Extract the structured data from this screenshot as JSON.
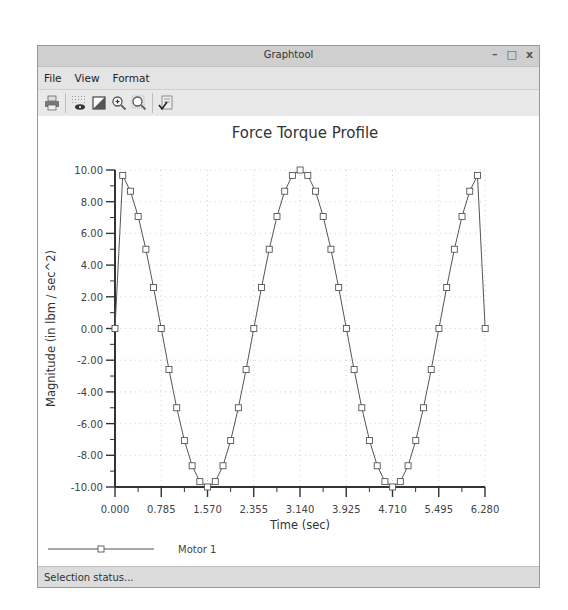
{
  "window": {
    "title": "Graphtool",
    "controls": {
      "minimize": "–",
      "maximize": "□",
      "close": "x"
    }
  },
  "menubar": {
    "items": [
      {
        "label": "File"
      },
      {
        "label": "View"
      },
      {
        "label": "Format"
      }
    ]
  },
  "toolbar": {
    "buttons": [
      {
        "name": "print",
        "icon": "printer-icon"
      },
      {
        "name": "grid-toggle",
        "icon": "grid-eye-icon"
      },
      {
        "name": "background",
        "icon": "fill-square-icon"
      },
      {
        "name": "zoom-in",
        "icon": "zoom-in-icon"
      },
      {
        "name": "zoom-fit",
        "icon": "zoom-fit-icon"
      },
      {
        "name": "properties",
        "icon": "check-document-icon"
      }
    ]
  },
  "statusbar": {
    "text": "Selection status..."
  },
  "colors": {
    "line": "#555555",
    "marker": "#555555",
    "axis": "#333333",
    "grid": "#bbbbbb",
    "titlebar": "#cfcfcf",
    "menubar": "#e4e4e4"
  },
  "chart_data": {
    "type": "line",
    "title": "Force Torque Profile",
    "xlabel": "Time (sec)",
    "ylabel": "Magnitude (in lbm / sec^2)",
    "xlim": [
      0,
      6.28
    ],
    "ylim": [
      -10,
      10
    ],
    "xticks": [
      "0.000",
      "0.785",
      "1.570",
      "2.355",
      "3.140",
      "3.925",
      "4.710",
      "5.495",
      "6.280"
    ],
    "yticks": [
      "10.00",
      "8.00",
      "6.00",
      "4.00",
      "2.00",
      "0.00",
      "-2.00",
      "-4.00",
      "-6.00",
      "-8.00",
      "-10.00"
    ],
    "grid": true,
    "legend_position": "bottom-left",
    "series": [
      {
        "name": "Motor 1",
        "marker": "square",
        "x": [
          0.0,
          0.131,
          0.262,
          0.393,
          0.524,
          0.654,
          0.785,
          0.916,
          1.047,
          1.178,
          1.309,
          1.44,
          1.571,
          1.702,
          1.833,
          1.963,
          2.094,
          2.225,
          2.356,
          2.487,
          2.618,
          2.749,
          2.88,
          3.011,
          3.142,
          3.272,
          3.403,
          3.534,
          3.665,
          3.796,
          3.927,
          4.058,
          4.189,
          4.32,
          4.451,
          4.581,
          4.712,
          4.843,
          4.974,
          5.105,
          5.236,
          5.367,
          5.498,
          5.629,
          5.76,
          5.89,
          6.021,
          6.152,
          6.283
        ],
        "values": [
          0.0,
          9.66,
          8.66,
          7.07,
          5.0,
          2.59,
          0.0,
          -2.59,
          -5.0,
          -7.07,
          -8.66,
          -9.66,
          -10.0,
          -9.66,
          -8.66,
          -7.07,
          -5.0,
          -2.59,
          0.0,
          2.59,
          5.0,
          7.07,
          8.66,
          9.66,
          10.0,
          9.66,
          8.66,
          7.07,
          5.0,
          2.59,
          0.0,
          -2.59,
          -5.0,
          -7.07,
          -8.66,
          -9.66,
          -10.0,
          -9.66,
          -8.66,
          -7.07,
          -5.0,
          -2.59,
          0.0,
          2.59,
          5.0,
          7.07,
          8.66,
          9.66,
          0.0
        ]
      }
    ]
  }
}
